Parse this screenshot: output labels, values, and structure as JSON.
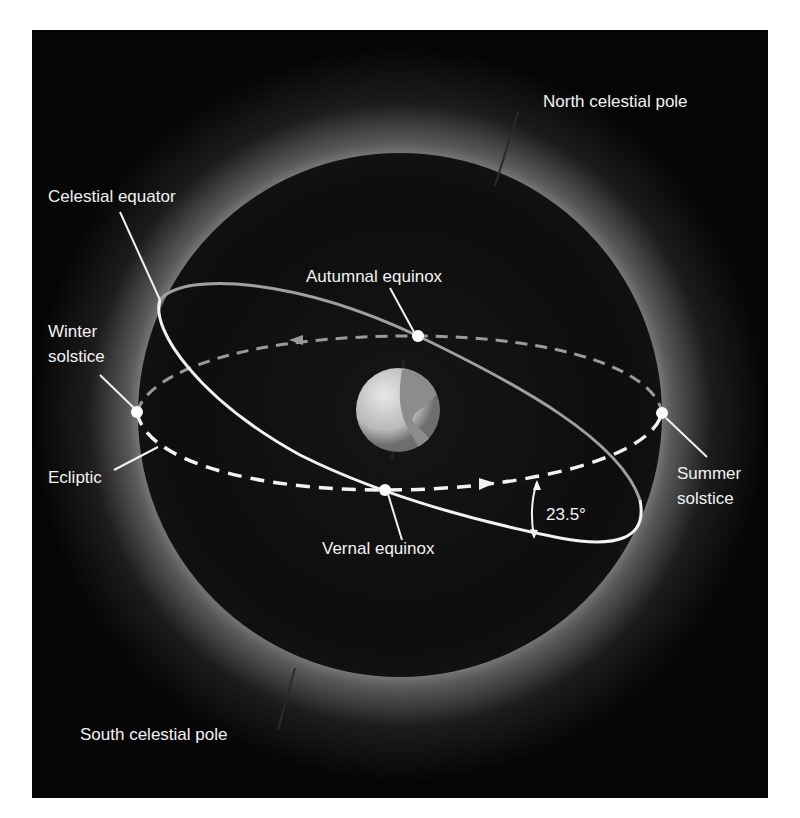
{
  "diagram": {
    "colors": {
      "page_background": "#ffffff",
      "panel_background": "#050505",
      "sphere_glow": "#8a8a8a",
      "sphere_interior": "#0b0b0b",
      "line_color": "#f2f2f2",
      "label_color": "#f2f2f2"
    },
    "labels": {
      "north_pole": "North celestial pole",
      "south_pole": "South celestial pole",
      "celestial_equator": "Celestial equator",
      "autumnal_equinox": "Autumnal equinox",
      "vernal_equinox": "Vernal equinox",
      "winter_solstice_line1": "Winter",
      "winter_solstice_line2": "solstice",
      "summer_solstice_line1": "Summer",
      "summer_solstice_line2": "solstice",
      "ecliptic": "Ecliptic",
      "tilt_angle": "23.5°"
    },
    "nodes": [
      {
        "name": "autumnal-equinox",
        "x": 418,
        "y": 336
      },
      {
        "name": "vernal-equinox",
        "x": 385,
        "y": 490
      },
      {
        "name": "winter-solstice",
        "x": 137,
        "y": 412
      },
      {
        "name": "summer-solstice",
        "x": 662,
        "y": 413
      }
    ],
    "center_body": "earth-globe"
  }
}
